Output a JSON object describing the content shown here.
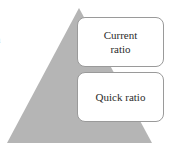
{
  "diagram": {
    "type": "pyramid",
    "triangle_color": "#b5b5b5",
    "box_border_color": "#9a9a9a",
    "text_color": "#2b2b2b",
    "levels": [
      {
        "label": "Current ratio",
        "line1": "Current",
        "line2": "ratio"
      },
      {
        "label": "Quick ratio",
        "line1": "Quick ratio",
        "line2": ""
      }
    ],
    "edge_fragment": "a"
  }
}
